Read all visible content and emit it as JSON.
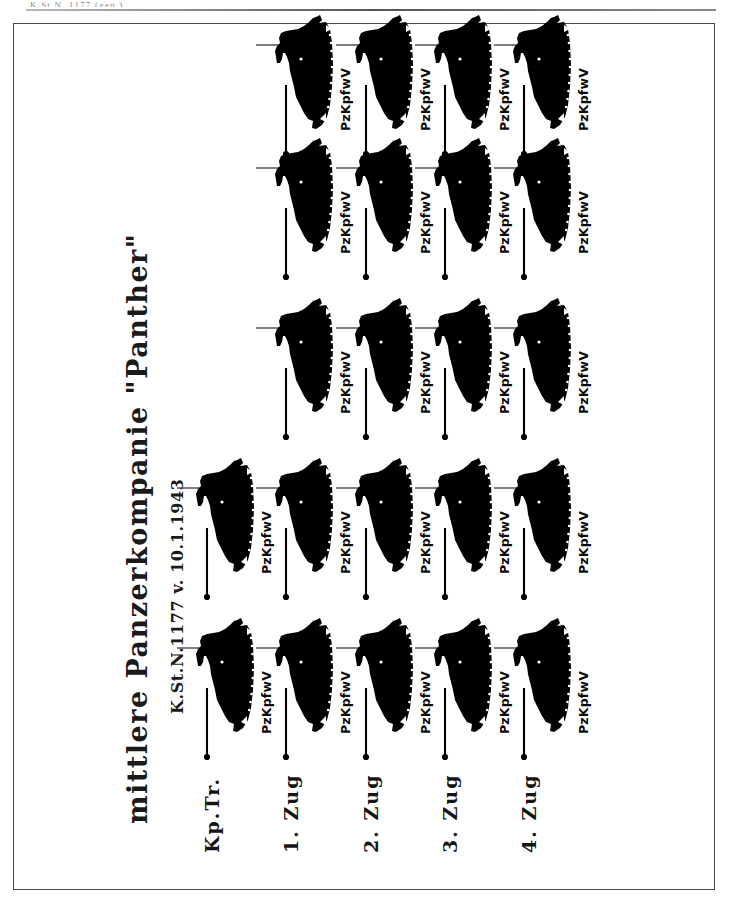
{
  "scan": {
    "top_header_text": "K.St.N. 1177 (gep.)",
    "page_bg": "#ffffff",
    "ink_color": "#000000",
    "frame_color": "#4a4a4a"
  },
  "chart": {
    "title": "mittlere Panzerkompanie \"Panther\"",
    "subtitle": "K.St.N.1177 v. 10.1.1943",
    "orientation": "rotated-90-ccw",
    "unit_symbol_name": "tank-silhouette-icon",
    "rows": [
      {
        "label": "Kp.Tr.",
        "name": "kompanietrupp",
        "vehicle_count": 2,
        "vehicles": [
          {
            "label": "PzKpfwV"
          },
          {
            "label": "PzKpfwV"
          }
        ]
      },
      {
        "label": "1. Zug",
        "name": "zug-1",
        "vehicle_count": 5,
        "vehicles": [
          {
            "label": "PzKpfwV"
          },
          {
            "label": "PzKpfwV"
          },
          {
            "label": "PzKpfwV"
          },
          {
            "label": "PzKpfwV"
          },
          {
            "label": "PzKpfwV"
          }
        ]
      },
      {
        "label": "2. Zug",
        "name": "zug-2",
        "vehicle_count": 5,
        "vehicles": [
          {
            "label": "PzKpfwV"
          },
          {
            "label": "PzKpfwV"
          },
          {
            "label": "PzKpfwV"
          },
          {
            "label": "PzKpfwV"
          },
          {
            "label": "PzKpfwV"
          }
        ]
      },
      {
        "label": "3. Zug",
        "name": "zug-3",
        "vehicle_count": 5,
        "vehicles": [
          {
            "label": "PzKpfwV"
          },
          {
            "label": "PzKpfwV"
          },
          {
            "label": "PzKpfwV"
          },
          {
            "label": "PzKpfwV"
          },
          {
            "label": "PzKpfwV"
          }
        ]
      },
      {
        "label": "4. Zug",
        "name": "zug-4",
        "vehicle_count": 5,
        "vehicles": [
          {
            "label": "PzKpfwV"
          },
          {
            "label": "PzKpfwV"
          },
          {
            "label": "PzKpfwV"
          },
          {
            "label": "PzKpfwV"
          },
          {
            "label": "PzKpfwV"
          }
        ]
      }
    ]
  }
}
